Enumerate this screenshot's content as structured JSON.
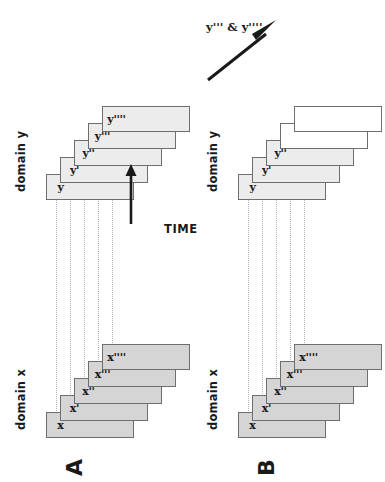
{
  "figure": {
    "orientation": "rotated-90-ccw",
    "background_color": "#ffffff",
    "colors": {
      "card_x_fill": "#d5d5d5",
      "card_y_fill": "#ececec",
      "card_blank_fill": "#ffffff",
      "card_stroke": "#6e6e6e",
      "connector": "#b4b4b4",
      "ink": "#1a1a1a"
    }
  },
  "panels": [
    {
      "letter": "A",
      "domain_x": {
        "label": "domain x",
        "cards": [
          {
            "label": "x",
            "state": "known"
          },
          {
            "label": "x'",
            "state": "known"
          },
          {
            "label": "x''",
            "state": "known"
          },
          {
            "label": "x'''",
            "state": "known"
          },
          {
            "label": "x''''",
            "state": "known"
          }
        ]
      },
      "domain_y": {
        "label": "domain y",
        "cards": [
          {
            "label": "y",
            "state": "known"
          },
          {
            "label": "y'",
            "state": "known"
          },
          {
            "label": "y''",
            "state": "known"
          },
          {
            "label": "y'''",
            "state": "known"
          },
          {
            "label": "y''''",
            "state": "known"
          }
        ]
      },
      "time_axis": {
        "label": "TIME",
        "direction": "left-to-right"
      },
      "connector_count": 5
    },
    {
      "letter": "B",
      "domain_x": {
        "label": "domain x",
        "cards": [
          {
            "label": "x",
            "state": "known"
          },
          {
            "label": "x'",
            "state": "known"
          },
          {
            "label": "x''",
            "state": "known"
          },
          {
            "label": "x'''",
            "state": "known"
          },
          {
            "label": "x''''",
            "state": "known"
          }
        ]
      },
      "domain_y": {
        "label": "domain y",
        "cards": [
          {
            "label": "y",
            "state": "known"
          },
          {
            "label": "y'",
            "state": "known"
          },
          {
            "label": "y''",
            "state": "known"
          },
          {
            "label": "",
            "state": "unknown"
          },
          {
            "label": "",
            "state": "unknown"
          }
        ]
      },
      "callout": {
        "label": "y''' & y''''"
      },
      "connector_count": 5
    }
  ]
}
